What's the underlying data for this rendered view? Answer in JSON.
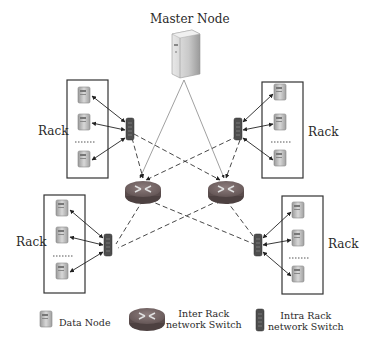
{
  "title": "Master Node",
  "racks": [
    {
      "label": "Rack",
      "position": "top-left"
    },
    {
      "label": "Rack",
      "position": "top-right"
    },
    {
      "label": "Rack",
      "position": "bottom-left"
    },
    {
      "label": "Rack",
      "position": "bottom-right"
    }
  ],
  "legend": {
    "data_node": "Data Node",
    "inter_rack_line1": "Inter Rack",
    "inter_rack_line2": "network Switch",
    "intra_rack_line1": "Intra Rack",
    "intra_rack_line2": "network Switch"
  },
  "colors": {
    "server": "#b8b8b8",
    "router": "#7a6a6a",
    "switch": "#5a5a5a",
    "line": "#333333"
  }
}
